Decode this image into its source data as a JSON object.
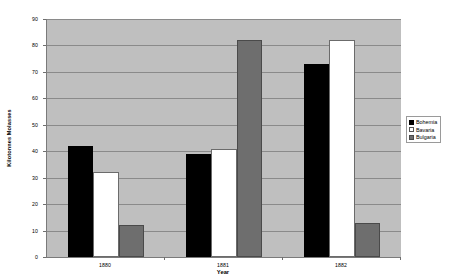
{
  "chart_data": {
    "type": "bar",
    "title": "",
    "subtitle": "",
    "xlabel": "Year",
    "ylabel": "Kilotonnes Molasses",
    "categories": [
      "1880",
      "1881",
      "1882"
    ],
    "series": [
      {
        "name": "Bohemia",
        "color": "#000000",
        "values": [
          42,
          39,
          73
        ]
      },
      {
        "name": "Bavaria",
        "color": "#ffffff",
        "values": [
          32,
          41,
          82
        ]
      },
      {
        "name": "Bulgaria",
        "color": "#6e6e6e",
        "values": [
          12,
          82,
          13
        ]
      }
    ],
    "ylim": [
      0,
      90
    ],
    "ytick_step": 10,
    "yticks": [
      0,
      10,
      20,
      30,
      40,
      50,
      60,
      70,
      80,
      90
    ],
    "grid": true,
    "grid_axis": "y",
    "legend_position": "right-outside",
    "plot_background": "#bfbfbf",
    "figure_background": "#ffffff",
    "gridline_color": "#8a8a8a",
    "axis_color": "#7a7a7a"
  },
  "legend": {
    "items": [
      {
        "label": "Bohemia"
      },
      {
        "label": "Bavaria"
      },
      {
        "label": "Bulgaria"
      }
    ]
  }
}
